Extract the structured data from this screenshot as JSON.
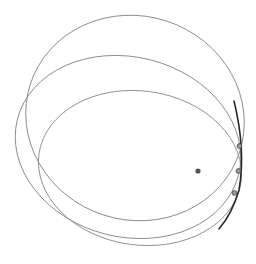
{
  "diagram": {
    "title": "",
    "canvas": {
      "width": 256,
      "height": 264,
      "background": "#ffffff"
    },
    "colors": {
      "orbit": "#8a8a8a",
      "tangent_arc": "#2a2a2a",
      "marker_fill": "#9a9a9a",
      "marker_stroke": "#444444",
      "focus": "#555555"
    },
    "orbits": [
      {
        "id": "orbit-1",
        "label": "",
        "cx": 135,
        "cy": 118,
        "rx": 110,
        "ry": 102,
        "rotate": 18
      },
      {
        "id": "orbit-2",
        "label": "",
        "cx": 128,
        "cy": 147,
        "rx": 114,
        "ry": 90,
        "rotate": 14
      },
      {
        "id": "orbit-3",
        "label": "",
        "cx": 140,
        "cy": 168,
        "rx": 102,
        "ry": 77,
        "rotate": 8
      }
    ],
    "focus_point": {
      "x": 198,
      "y": 171,
      "r": 2.6
    },
    "tangent_arc": {
      "path": "M234,101 Q246,150 239,190 Q232,214 219,229"
    },
    "markers": [
      {
        "x": 239.5,
        "y": 146,
        "r": 2.4
      },
      {
        "x": 238.5,
        "y": 171,
        "r": 2.4
      },
      {
        "x": 234.5,
        "y": 193,
        "r": 2.4
      }
    ]
  }
}
